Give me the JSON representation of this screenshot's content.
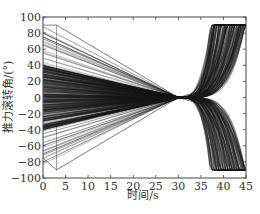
{
  "chart_data": {
    "type": "line",
    "title": "",
    "xlabel": "时间/s",
    "ylabel": "推力滚转角/(°)",
    "xlim": [
      0,
      45
    ],
    "ylim": [
      -100,
      100
    ],
    "xticks": [
      0,
      5,
      10,
      15,
      20,
      25,
      30,
      35,
      40,
      45
    ],
    "yticks": [
      -100,
      -80,
      -60,
      -40,
      -20,
      0,
      20,
      40,
      60,
      80,
      100
    ],
    "grid": false,
    "legend": null,
    "line_color": "#1a1a1a",
    "series_summary": {
      "count_approx": 400,
      "start_time_range_s": [
        0,
        3
      ],
      "start_value_range_deg": [
        -90,
        90
      ],
      "dense_start_band_deg": [
        -40,
        40
      ],
      "convergence_time_s": 30,
      "convergence_value_deg": 0,
      "divergence_start_s": 35,
      "saturation_value_deg": 90,
      "saturation_time_range_s": [
        38,
        45
      ]
    },
    "sample_series": [
      {
        "name": "outlier-high-1",
        "x": [
          0,
          3,
          30
        ],
        "y": [
          90,
          90,
          0
        ]
      },
      {
        "name": "outlier-high-2",
        "x": [
          0,
          30
        ],
        "y": [
          80,
          0
        ]
      },
      {
        "name": "outlier-low-1",
        "x": [
          0,
          3,
          30
        ],
        "y": [
          -75,
          -90,
          0
        ]
      },
      {
        "name": "outlier-low-2",
        "x": [
          0,
          30
        ],
        "y": [
          -70,
          0
        ]
      },
      {
        "name": "typical-upper",
        "x": [
          0,
          30,
          35,
          40,
          42
        ],
        "y": [
          40,
          0,
          8,
          50,
          90
        ]
      },
      {
        "name": "typical-lower",
        "x": [
          0,
          30,
          35,
          40,
          42
        ],
        "y": [
          -40,
          0,
          -8,
          -50,
          -90
        ]
      }
    ]
  },
  "axes": {
    "x_tick_labels": [
      "0",
      "5",
      "10",
      "15",
      "20",
      "25",
      "30",
      "35",
      "40",
      "45"
    ],
    "y_tick_labels": [
      "100",
      "80",
      "60",
      "40",
      "20",
      "0",
      "−20",
      "−40",
      "−60",
      "−80",
      "−100"
    ]
  }
}
